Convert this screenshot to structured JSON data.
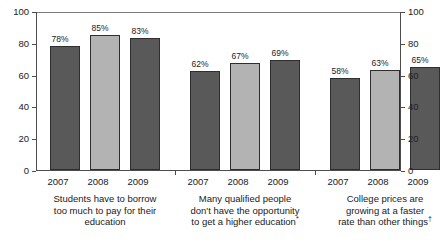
{
  "chart_data": {
    "type": "bar",
    "title": "",
    "subtitle": "",
    "xlabel": "",
    "ylabel": "",
    "ylim": [
      0,
      100
    ],
    "yticks": [
      0,
      20,
      40,
      60,
      80,
      100
    ],
    "ytick_labels": [
      "0",
      "20",
      "40",
      "60",
      "80",
      "100"
    ],
    "right_axis": true,
    "right_ytick_labels": [
      "0",
      "20",
      "40",
      "60",
      "80",
      "100"
    ],
    "grid": false,
    "legend": "none",
    "categories": [
      "2007",
      "2008",
      "2009"
    ],
    "groups": [
      {
        "caption_lines": [
          "Students have to borrow",
          "too much to pay for their",
          "education"
        ],
        "caption_marker": "",
        "bars": [
          {
            "year": "2007",
            "value": 78,
            "label": "78%",
            "shade": "dark"
          },
          {
            "year": "2008",
            "value": 85,
            "label": "85%",
            "shade": "light"
          },
          {
            "year": "2009",
            "value": 83,
            "label": "83%",
            "shade": "dark"
          }
        ]
      },
      {
        "caption_lines": [
          "Many qualified people",
          "don't have the opportunity",
          "to get a higher education"
        ],
        "caption_marker": "*",
        "bars": [
          {
            "year": "2007",
            "value": 62,
            "label": "62%",
            "shade": "dark"
          },
          {
            "year": "2008",
            "value": 67,
            "label": "67%",
            "shade": "light"
          },
          {
            "year": "2009",
            "value": 69,
            "label": "69%",
            "shade": "dark"
          }
        ]
      },
      {
        "caption_lines": [
          "College prices are",
          "growing at a faster",
          "rate than other things"
        ],
        "caption_marker": "†",
        "bars": [
          {
            "year": "2007",
            "value": 58,
            "label": "58%",
            "shade": "dark"
          },
          {
            "year": "2008",
            "value": 63,
            "label": "63%",
            "shade": "light"
          },
          {
            "year": "2009",
            "value": 65,
            "label": "65%",
            "shade": "dark"
          }
        ]
      }
    ],
    "colors": {
      "bar_dark": "#595959",
      "bar_light": "#b3b3b3",
      "bar_border": "#2e2e2e",
      "axis": "#4d4d4d",
      "text": "#1a1a1a",
      "background": "#ffffff"
    }
  }
}
